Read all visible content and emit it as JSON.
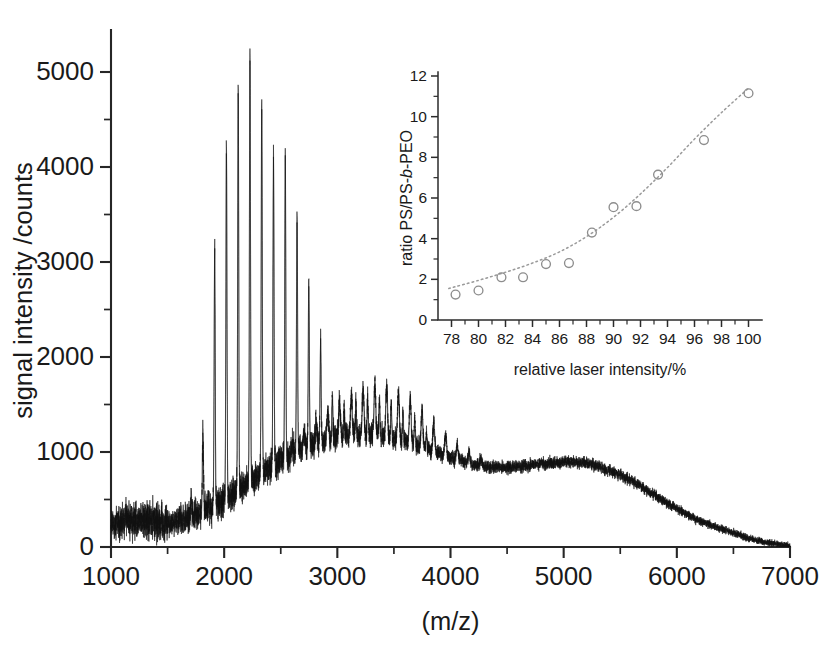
{
  "figure": {
    "name": "maldi-tof-mass-spectrum-with-inset",
    "background": "#ffffff",
    "ink_color": "#111111",
    "marker_color": "#8d8d8d"
  },
  "chart_data": [
    {
      "id": "main",
      "type": "line",
      "title": "",
      "xlabel": "(m/z)",
      "ylabel": "signal intensity /counts",
      "xlim": [
        1000,
        7000
      ],
      "ylim": [
        0,
        5400
      ],
      "grid": false,
      "legend": null,
      "x_ticks": [
        1000,
        2000,
        3000,
        4000,
        5000,
        6000,
        7000
      ],
      "x_tick_labels": [
        "1000",
        "2000",
        "3000",
        "4000",
        "5000",
        "6000",
        "7000"
      ],
      "x_minor_step": 500,
      "y_ticks": [
        0,
        1000,
        2000,
        3000,
        4000,
        5000
      ],
      "y_tick_labels": [
        "0",
        "1000",
        "2000",
        "3000",
        "4000",
        "5000"
      ],
      "y_minor_step": 500,
      "description": "MALDI-TOF spectrum: sharp resolved oligomer peak series 1600-4200 m/z superimposed on broad distributions, plus a smooth broad hump centred near 5200 m/z",
      "baseline_noise_counts": 60,
      "series": [
        {
          "name": "sharp oligomer peak series (PS)",
          "comb_spacing_mz": 104,
          "comb_start_mz": 1604,
          "comb_end_mz": 4204,
          "peak_apex_mz": [
            1604,
            1708,
            1812,
            1916,
            2020,
            2124,
            2228,
            2332,
            2436,
            2540,
            2644,
            2748,
            2852,
            2956,
            3060,
            3164,
            3268,
            3372,
            3476,
            3580,
            3684,
            3788,
            3892,
            3996,
            4100,
            4204
          ],
          "peak_apex_counts": [
            310,
            540,
            1180,
            3120,
            4220,
            4830,
            5220,
            4700,
            4120,
            4120,
            3520,
            2810,
            2150,
            1560,
            1450,
            1500,
            1540,
            1560,
            1510,
            1450,
            1380,
            1200,
            1000,
            820,
            640,
            480
          ]
        },
        {
          "name": "broad envelope A",
          "center_mz": 3400,
          "peak_counts": 1000,
          "width_mz": 1100
        },
        {
          "name": "broad envelope B (high mass hump)",
          "center_mz": 5200,
          "peak_counts": 750,
          "width_mz": 900
        }
      ]
    },
    {
      "id": "inset",
      "type": "scatter",
      "title": "",
      "xlabel": "relative laser intensity/%",
      "ylabel": "ratio PS/PS-b-PEO",
      "ylabel_parts": [
        {
          "text": "ratio PS/PS-",
          "italic": false
        },
        {
          "text": "b",
          "italic": true
        },
        {
          "text": "-PEO",
          "italic": false
        }
      ],
      "xlim": [
        77,
        101
      ],
      "ylim": [
        0,
        12
      ],
      "grid": false,
      "legend": null,
      "x_ticks": [
        78,
        80,
        82,
        84,
        86,
        88,
        90,
        92,
        94,
        96,
        98,
        100
      ],
      "x_tick_labels": [
        "78",
        "80",
        "82",
        "84",
        "86",
        "88",
        "90",
        "92",
        "94",
        "96",
        "98",
        "100"
      ],
      "x_minor_step": 1,
      "y_ticks": [
        0,
        2,
        4,
        6,
        8,
        10,
        12
      ],
      "y_tick_labels": [
        "0",
        "2",
        "4",
        "6",
        "8",
        "10",
        "12"
      ],
      "y_minor_step": 1,
      "marker_style": "open-circle",
      "fit_style": "dotted",
      "x": [
        78.3,
        80.0,
        81.7,
        83.3,
        85.0,
        86.7,
        88.4,
        90.0,
        91.7,
        93.3,
        96.7,
        100.0
      ],
      "y": [
        1.25,
        1.45,
        2.1,
        2.1,
        2.75,
        2.8,
        4.3,
        5.55,
        5.6,
        7.15,
        8.85,
        11.15
      ],
      "fit_curve": {
        "type": "exponential-trend",
        "x": [
          77.8,
          80,
          82,
          84,
          86,
          88,
          90,
          92,
          94,
          96,
          98,
          100
        ],
        "y": [
          1.55,
          1.95,
          2.35,
          2.8,
          3.35,
          4.1,
          5.05,
          6.2,
          7.5,
          8.9,
          10.2,
          11.4
        ]
      }
    }
  ]
}
